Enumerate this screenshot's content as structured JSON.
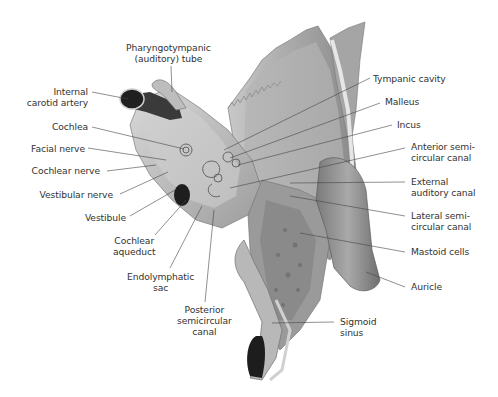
{
  "figure": {
    "labels_left": [
      {
        "id": "pharyngotympanic-tube",
        "lines": [
          "Pharyngotympanic",
          "(auditory) tube"
        ]
      },
      {
        "id": "internal-carotid-artery",
        "lines": [
          "Internal",
          "carotid artery"
        ]
      },
      {
        "id": "cochlea",
        "lines": [
          "Cochlea"
        ]
      },
      {
        "id": "facial-nerve",
        "lines": [
          "Facial nerve"
        ]
      },
      {
        "id": "cochlear-nerve",
        "lines": [
          "Cochlear nerve"
        ]
      },
      {
        "id": "vestibular-nerve",
        "lines": [
          "Vestibular nerve"
        ]
      },
      {
        "id": "vestibule",
        "lines": [
          "Vestibule"
        ]
      },
      {
        "id": "cochlear-aqueduct",
        "lines": [
          "Cochlear",
          "aqueduct"
        ]
      },
      {
        "id": "endolymphatic-sac",
        "lines": [
          "Endolymphatic",
          "sac"
        ]
      },
      {
        "id": "posterior-semicircular-canal",
        "lines": [
          "Posterior",
          "semicircular",
          "canal"
        ]
      }
    ],
    "labels_right": [
      {
        "id": "tympanic-cavity",
        "lines": [
          "Tympanic cavity"
        ]
      },
      {
        "id": "malleus",
        "lines": [
          "Malleus"
        ]
      },
      {
        "id": "incus",
        "lines": [
          "Incus"
        ]
      },
      {
        "id": "anterior-semicircular-canal",
        "lines": [
          "Anterior semi-",
          "circular canal"
        ]
      },
      {
        "id": "external-auditory-canal",
        "lines": [
          "External",
          "auditory canal"
        ]
      },
      {
        "id": "lateral-semicircular-canal",
        "lines": [
          "Lateral semi-",
          "circular canal"
        ]
      },
      {
        "id": "mastoid-cells",
        "lines": [
          "Mastoid cells"
        ]
      },
      {
        "id": "auricle",
        "lines": [
          "Auricle"
        ]
      },
      {
        "id": "sigmoid-sinus",
        "lines": [
          "Sigmoid",
          "sinus"
        ]
      }
    ]
  }
}
